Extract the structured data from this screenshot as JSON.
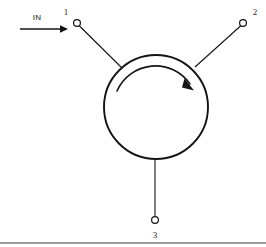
{
  "figure": {
    "kind": "circulator-schematic",
    "stroke_color": "#141414",
    "background_color": "#ffffff",
    "baseline_rule_color": "#3a3a3a"
  },
  "flow": {
    "label": "IN",
    "arrow_name": "input-flow-arrow",
    "direction": "right"
  },
  "body": {
    "name": "circulator-body",
    "center_x": 156,
    "center_y": 107,
    "radius": 52
  },
  "circulation": {
    "name": "circulation-direction-arc",
    "direction_label": "clockwise"
  },
  "ports": [
    {
      "id": "port-1",
      "label": "1",
      "terminal_x": 77,
      "terminal_y": 23,
      "label_x": 66,
      "label_y": 15
    },
    {
      "id": "port-2",
      "label": "2",
      "terminal_x": 243,
      "terminal_y": 23,
      "label_x": 254,
      "label_y": 15
    },
    {
      "id": "port-3",
      "label": "3",
      "terminal_x": 155,
      "terminal_y": 220,
      "label_x": 155,
      "label_y": 238
    }
  ],
  "footer": {
    "rule_name": "bottom-separator-rule",
    "rule_y": 243
  }
}
